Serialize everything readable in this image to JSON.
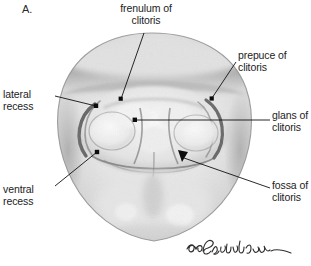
{
  "figure": {
    "panel_letter": "A.",
    "signature": "Constantine",
    "colors": {
      "background": "#ffffff",
      "text": "#1c1c1c",
      "leader_line": "#111111",
      "graphite_light": "#e9e9e9",
      "graphite_mid": "#bdbdbd",
      "graphite_dark": "#6f6f6f"
    }
  },
  "labels": {
    "frenulum": "frenulum of\nclitoris",
    "prepuce": "prepuce of\nclitoris",
    "glans": "glans of\nclitoris",
    "fossa": "fossa of\nclitoris",
    "lateral_recess": "lateral\nrecess",
    "ventral_recess": "ventral\nrecess"
  }
}
